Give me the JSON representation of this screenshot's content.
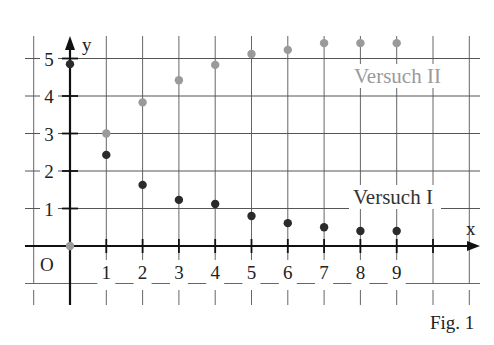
{
  "chart_data": {
    "type": "scatter",
    "title": "",
    "xlabel": "x",
    "ylabel": "y",
    "origin_label": "O",
    "figure_caption": "Fig. 1",
    "xlim": [
      -1,
      11
    ],
    "ylim": [
      -1,
      5.5
    ],
    "x_ticks": [
      1,
      2,
      3,
      4,
      5,
      6,
      7,
      8,
      9
    ],
    "x_tick_labels": [
      "1",
      "2",
      "3",
      "4",
      "5",
      "6",
      "7",
      "8",
      "9"
    ],
    "y_ticks": [
      1,
      2,
      3,
      4,
      5
    ],
    "y_tick_labels": [
      "1",
      "2",
      "3",
      "4",
      "5"
    ],
    "grid": true,
    "legend": "inline labels",
    "series": [
      {
        "name": "Versuch I",
        "label": "Versuch I",
        "color": "#2b2b2b",
        "x": [
          0,
          1,
          2,
          3,
          4,
          5,
          6,
          7,
          8,
          9
        ],
        "y": [
          4.85,
          2.43,
          1.63,
          1.23,
          1.12,
          0.8,
          0.61,
          0.5,
          0.4,
          0.4
        ]
      },
      {
        "name": "Versuch II",
        "label": "Versuch II",
        "color": "#9a9a9a",
        "x": [
          0,
          1,
          2,
          3,
          4,
          5,
          6,
          7,
          8,
          9
        ],
        "y": [
          0,
          3.0,
          3.83,
          4.42,
          4.83,
          5.12,
          5.23,
          5.41,
          5.41,
          5.41
        ]
      }
    ]
  }
}
